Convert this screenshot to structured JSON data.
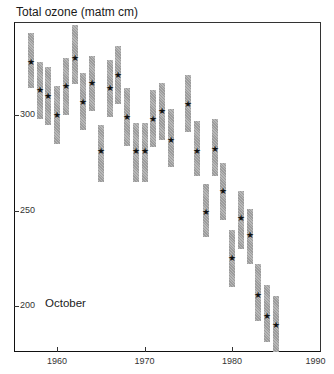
{
  "chart_data": {
    "type": "scatter",
    "title": "Total ozone (matm cm)",
    "ylabel": "Total ozone (matm cm)",
    "xlabel": "",
    "annotation": "October",
    "xlim": [
      1955,
      1990
    ],
    "ylim": [
      176,
      345
    ],
    "xticks": [
      1960,
      1970,
      1980,
      1990
    ],
    "yticks": [
      200,
      250,
      300
    ],
    "grid": false,
    "legend": null,
    "marker": "star",
    "error_bars": "shaded vertical bars",
    "series": [
      {
        "name": "October mean total ozone",
        "points": [
          {
            "year": 1957,
            "value": 328,
            "low": 314,
            "high": 343
          },
          {
            "year": 1958,
            "value": 313,
            "low": 298,
            "high": 328
          },
          {
            "year": 1959,
            "value": 310,
            "low": 295,
            "high": 325
          },
          {
            "year": 1960,
            "value": 300,
            "low": 285,
            "high": 315
          },
          {
            "year": 1961,
            "value": 315,
            "low": 300,
            "high": 330
          },
          {
            "year": 1962,
            "value": 330,
            "low": 316,
            "high": 347
          },
          {
            "year": 1963,
            "value": 307,
            "low": 292,
            "high": 322
          },
          {
            "year": 1964,
            "value": 317,
            "low": 302,
            "high": 331
          },
          {
            "year": 1965,
            "value": 281,
            "low": 265,
            "high": 295
          },
          {
            "year": 1966,
            "value": 314,
            "low": 299,
            "high": 329
          },
          {
            "year": 1967,
            "value": 321,
            "low": 306,
            "high": 336
          },
          {
            "year": 1968,
            "value": 299,
            "low": 284,
            "high": 314
          },
          {
            "year": 1969,
            "value": 281,
            "low": 265,
            "high": 296
          },
          {
            "year": 1970,
            "value": 281,
            "low": 265,
            "high": 296
          },
          {
            "year": 1971,
            "value": 298,
            "low": 283,
            "high": 313
          },
          {
            "year": 1972,
            "value": 302,
            "low": 287,
            "high": 317
          },
          {
            "year": 1973,
            "value": 287,
            "low": 273,
            "high": 303
          },
          {
            "year": 1975,
            "value": 306,
            "low": 291,
            "high": 321
          },
          {
            "year": 1976,
            "value": 281,
            "low": 268,
            "high": 297
          },
          {
            "year": 1977,
            "value": 249,
            "low": 236,
            "high": 264
          },
          {
            "year": 1978,
            "value": 282,
            "low": 268,
            "high": 298
          },
          {
            "year": 1979,
            "value": 260,
            "low": 245,
            "high": 275
          },
          {
            "year": 1980,
            "value": 225,
            "low": 210,
            "high": 240
          },
          {
            "year": 1981,
            "value": 246,
            "low": 230,
            "high": 260
          },
          {
            "year": 1982,
            "value": 237,
            "low": 222,
            "high": 251
          },
          {
            "year": 1983,
            "value": 206,
            "low": 192,
            "high": 222
          },
          {
            "year": 1984,
            "value": 195,
            "low": 181,
            "high": 211
          },
          {
            "year": 1985,
            "value": 190,
            "low": 175,
            "high": 205
          }
        ]
      }
    ]
  },
  "layout": {
    "y_px_at_300": 115,
    "px_per_unit": 1.91,
    "x_px_at_1960": 57,
    "px_per_year": 8.75,
    "bar_color": "#a8a8a8",
    "star_glyph": "★"
  }
}
